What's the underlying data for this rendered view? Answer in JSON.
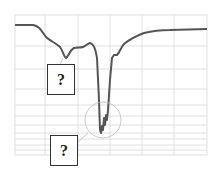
{
  "diagram": {
    "type": "spectrum-curve",
    "line_color": "#555555",
    "grid_color": "#d8d8d8",
    "callouts": [
      {
        "id": "shoulder-dip",
        "label": "?"
      },
      {
        "id": "deep-trough",
        "label": "?"
      }
    ]
  }
}
